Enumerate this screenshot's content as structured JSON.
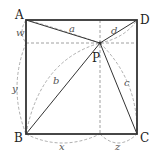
{
  "diagram": {
    "type": "geometry",
    "vertices": {
      "A": {
        "label": "A",
        "x": 26,
        "y": 20
      },
      "D": {
        "label": "D",
        "x": 137,
        "y": 20
      },
      "B": {
        "label": "B",
        "x": 26,
        "y": 134
      },
      "C": {
        "label": "C",
        "x": 137,
        "y": 134
      },
      "P": {
        "label": "P",
        "x": 100,
        "y": 43
      }
    },
    "segment_labels": {
      "PA": "a",
      "PB": "b",
      "PC": "c",
      "PD": "d"
    },
    "distance_labels": {
      "top_left_vertical": "w",
      "bottom_left_vertical": "y",
      "bottom_left_horizontal": "x",
      "bottom_right_horizontal": "z"
    },
    "colors": {
      "square": "#333333",
      "segments": "#333333",
      "dashed": "#888888"
    }
  }
}
